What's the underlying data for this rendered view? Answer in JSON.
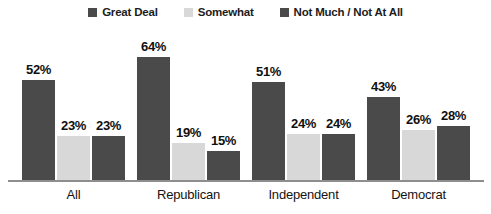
{
  "chart_data": {
    "type": "bar",
    "title": "",
    "subtitle": "",
    "xlabel": "",
    "ylabel": "",
    "ylim": [
      0,
      70
    ],
    "grid": false,
    "legend_position": "top-center",
    "value_suffix": "%",
    "categories": [
      "All",
      "Republican",
      "Independent",
      "Democrat"
    ],
    "series": [
      {
        "name": "Great Deal",
        "color": "#4a4a4a",
        "values": [
          52,
          64,
          51,
          43
        ],
        "labels": [
          "52%",
          "64%",
          "51%",
          "43%"
        ]
      },
      {
        "name": "Somewhat",
        "color": "#d8d8d8",
        "values": [
          23,
          19,
          24,
          26
        ],
        "labels": [
          "23%",
          "19%",
          "24%",
          "26%"
        ]
      },
      {
        "name": "Not Much / Not At All",
        "color": "#4a4a4a",
        "values": [
          23,
          15,
          24,
          28
        ],
        "labels": [
          "23%",
          "15%",
          "24%",
          "28%"
        ]
      }
    ]
  },
  "legend": {
    "items": [
      {
        "label": "Great Deal",
        "color": "#4a4a4a"
      },
      {
        "label": "Somewhat",
        "color": "#d8d8d8"
      },
      {
        "label": "Not Much / Not At All",
        "color": "#4a4a4a"
      }
    ]
  },
  "axis": {
    "line_color": "#8e8e8e",
    "categories": [
      "All",
      "Republican",
      "Independent",
      "Democrat"
    ]
  }
}
